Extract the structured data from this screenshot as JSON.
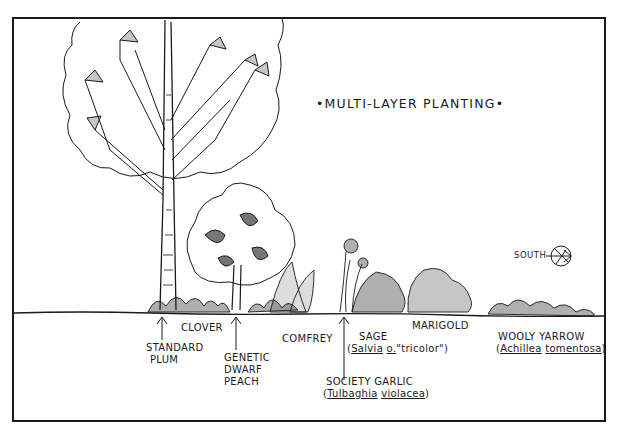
{
  "title": "•MULTI-LAYER PLANTING•",
  "compass": {
    "label": "SOUTH",
    "icon": "compass-arrow-icon"
  },
  "labels": {
    "standard_plum": [
      "STANDARD",
      "PLUM"
    ],
    "clover": "CLOVER",
    "genetic_dwarf_peach": [
      "GENETIC",
      "DWARF",
      "PEACH"
    ],
    "comfrey": "COMFREY",
    "sage": {
      "common": "SAGE",
      "open": "(",
      "genus": "Salvia",
      "species": "o.",
      "cultivar": "\"tricolor\")"
    },
    "society_garlic": {
      "common": "SOCIETY GARLIC",
      "open": "(",
      "genus": "Tulbaghia",
      "species": "violacea",
      "close": ")"
    },
    "marigold": "MARIGOLD",
    "wooly_yarrow": {
      "common": "WOOLY YARROW",
      "open": "(",
      "genus": "Achillea",
      "species": "tomentosa",
      "close": ")"
    }
  },
  "colors": {
    "ink": "#1a1a1a",
    "paper": "#ffffff"
  }
}
